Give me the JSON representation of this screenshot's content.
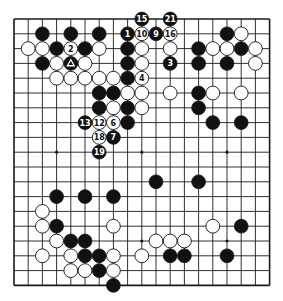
{
  "board": {
    "size": 19,
    "origin": {
      "x": 14,
      "y": 19
    },
    "spacing": {
      "x": 14.2,
      "y": 14.8
    },
    "stone_radius": 6.9,
    "colors": {
      "black": "#111111",
      "white": "#ffffff",
      "lines": "#1a1a1a",
      "background": "#ffffff"
    },
    "star_points": [
      [
        3,
        3
      ],
      [
        9,
        3
      ],
      [
        15,
        3
      ],
      [
        3,
        9
      ],
      [
        9,
        9
      ],
      [
        15,
        9
      ],
      [
        3,
        15
      ],
      [
        9,
        15
      ],
      [
        15,
        15
      ]
    ]
  },
  "stones": {
    "black": [
      [
        2,
        1
      ],
      [
        4,
        1
      ],
      [
        6,
        1
      ],
      [
        3,
        2
      ],
      [
        5,
        2
      ],
      [
        2,
        3
      ],
      [
        8,
        2
      ],
      [
        8,
        3
      ],
      [
        8,
        4
      ],
      [
        6,
        5
      ],
      [
        7,
        5
      ],
      [
        6,
        6
      ],
      [
        8,
        6
      ],
      [
        8,
        7
      ],
      [
        15,
        1
      ],
      [
        13,
        2
      ],
      [
        16,
        2
      ],
      [
        13,
        3
      ],
      [
        15,
        3
      ],
      [
        13,
        5
      ],
      [
        13,
        6
      ],
      [
        14,
        7
      ],
      [
        16,
        7
      ],
      [
        10,
        11
      ],
      [
        13,
        11
      ],
      [
        3,
        12
      ],
      [
        5,
        12
      ],
      [
        7,
        12
      ],
      [
        3,
        14
      ],
      [
        16,
        14
      ],
      [
        4,
        15
      ],
      [
        5,
        15
      ],
      [
        5,
        16
      ],
      [
        6,
        16
      ],
      [
        11,
        16
      ],
      [
        12,
        16
      ],
      [
        15,
        16
      ],
      [
        6,
        17
      ],
      [
        7,
        18
      ]
    ],
    "white": [
      [
        1,
        2
      ],
      [
        2,
        2
      ],
      [
        6,
        2
      ],
      [
        3,
        3
      ],
      [
        5,
        3
      ],
      [
        9,
        2
      ],
      [
        9,
        3
      ],
      [
        11,
        2
      ],
      [
        3,
        4
      ],
      [
        4,
        4
      ],
      [
        5,
        4
      ],
      [
        6,
        4
      ],
      [
        7,
        4
      ],
      [
        8,
        5
      ],
      [
        9,
        5
      ],
      [
        11,
        5
      ],
      [
        7,
        6
      ],
      [
        9,
        6
      ],
      [
        16,
        1
      ],
      [
        14,
        2
      ],
      [
        15,
        2
      ],
      [
        17,
        2
      ],
      [
        17,
        3
      ],
      [
        14,
        5
      ],
      [
        16,
        5
      ],
      [
        2,
        13
      ],
      [
        2,
        14
      ],
      [
        7,
        14
      ],
      [
        14,
        14
      ],
      [
        3,
        15
      ],
      [
        10,
        15
      ],
      [
        11,
        15
      ],
      [
        12,
        15
      ],
      [
        2,
        16
      ],
      [
        4,
        16
      ],
      [
        7,
        16
      ],
      [
        9,
        16
      ],
      [
        4,
        17
      ],
      [
        5,
        17
      ],
      [
        7,
        17
      ]
    ]
  },
  "numbered_moves": [
    {
      "n": "1",
      "color": "black",
      "pos": [
        8,
        1
      ]
    },
    {
      "n": "2",
      "color": "white",
      "pos": [
        4,
        2
      ]
    },
    {
      "n": "3",
      "color": "black",
      "pos": [
        11,
        3
      ]
    },
    {
      "n": "4",
      "color": "white",
      "pos": [
        9,
        4
      ]
    },
    {
      "n": "6",
      "color": "white",
      "pos": [
        7,
        7
      ]
    },
    {
      "n": "7",
      "color": "black",
      "pos": [
        7,
        8
      ]
    },
    {
      "n": "9",
      "color": "black",
      "pos": [
        10,
        1
      ]
    },
    {
      "n": "10",
      "color": "white",
      "pos": [
        9,
        1
      ]
    },
    {
      "n": "12",
      "color": "white",
      "pos": [
        6,
        7
      ]
    },
    {
      "n": "13",
      "color": "black",
      "pos": [
        5,
        7
      ]
    },
    {
      "n": "15",
      "color": "black",
      "pos": [
        9,
        0
      ]
    },
    {
      "n": "16",
      "color": "white",
      "pos": [
        11,
        1
      ]
    },
    {
      "n": "18",
      "color": "white",
      "pos": [
        6,
        8
      ]
    },
    {
      "n": "19",
      "color": "black",
      "pos": [
        6,
        9
      ]
    },
    {
      "n": "21",
      "color": "black",
      "pos": [
        11,
        0
      ]
    }
  ],
  "marked_stones": [
    {
      "mark": "triangle",
      "color": "black",
      "pos": [
        4,
        3
      ]
    }
  ]
}
